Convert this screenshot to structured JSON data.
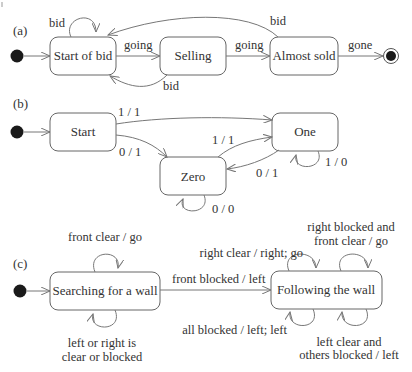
{
  "diagram": {
    "panels": [
      {
        "label": "(a)",
        "states": [
          "Start of bid",
          "Selling",
          "Almost sold"
        ],
        "transitions": [
          {
            "from": "initial",
            "to": "Start of bid",
            "label": ""
          },
          {
            "from": "Start of bid",
            "to": "Start of bid",
            "label": "bid"
          },
          {
            "from": "Start of bid",
            "to": "Selling",
            "label": "going"
          },
          {
            "from": "Selling",
            "to": "Start of bid",
            "label": "bid"
          },
          {
            "from": "Selling",
            "to": "Almost sold",
            "label": "going"
          },
          {
            "from": "Almost sold",
            "to": "Start of bid",
            "label": "bid"
          },
          {
            "from": "Almost sold",
            "to": "final",
            "label": "gone"
          }
        ]
      },
      {
        "label": "(b)",
        "states": [
          "Start",
          "One",
          "Zero"
        ],
        "transitions": [
          {
            "from": "initial",
            "to": "Start",
            "label": ""
          },
          {
            "from": "Start",
            "to": "One",
            "label": "1 / 1"
          },
          {
            "from": "Start",
            "to": "Zero",
            "label": "0 / 1"
          },
          {
            "from": "Zero",
            "to": "One",
            "label": "1 / 1"
          },
          {
            "from": "One",
            "to": "Zero",
            "label": "0 / 1"
          },
          {
            "from": "One",
            "to": "One",
            "label": "1 / 0"
          },
          {
            "from": "Zero",
            "to": "Zero",
            "label": "0 / 0"
          }
        ]
      },
      {
        "label": "(c)",
        "states": [
          "Searching for a wall",
          "Following the wall"
        ],
        "transitions": [
          {
            "from": "initial",
            "to": "Searching for a wall",
            "label": ""
          },
          {
            "from": "Searching for a wall",
            "to": "Searching for a wall",
            "label": "front clear / go"
          },
          {
            "from": "Searching for a wall",
            "to": "Searching for a wall",
            "label_lines": [
              "left or right is",
              "clear or blocked"
            ]
          },
          {
            "from": "Searching for a wall",
            "to": "Following the wall",
            "label": "front blocked / left"
          },
          {
            "from": "Following the wall",
            "to": "Following the wall",
            "label": "right clear / right; go"
          },
          {
            "from": "Following the wall",
            "to": "Following the wall",
            "label_lines": [
              "right blocked and",
              "front clear / go"
            ]
          },
          {
            "from": "Following the wall",
            "to": "Following the wall",
            "label": "all blocked / left; left"
          },
          {
            "from": "Following the wall",
            "to": "Following the wall",
            "label_lines": [
              "left clear and",
              "others blocked / left"
            ]
          }
        ]
      }
    ]
  },
  "a": {
    "label": "(a)",
    "s1": "Start of bid",
    "s2": "Selling",
    "s3": "Almost sold",
    "t_self": "bid",
    "t_going1": "going",
    "t_back": "bid",
    "t_going2": "going",
    "t_top": "bid",
    "t_gone": "gone"
  },
  "b": {
    "label": "(b)",
    "s1": "Start",
    "s2": "One",
    "s3": "Zero",
    "t_start_one": "1 / 1",
    "t_start_zero": "0 / 1",
    "t_zero_one": "1 / 1",
    "t_one_zero": "0 / 1",
    "t_one_self": "1 / 0",
    "t_zero_self": "0 / 0"
  },
  "c": {
    "label": "(c)",
    "s1": "Searching for a wall",
    "s2": "Following the wall",
    "t_s1_top": "front clear / go",
    "t_s1_bottom_1": "left or right is",
    "t_s1_bottom_2": "clear or blocked",
    "t_s1_s2": "front blocked / left",
    "t_s2_topleft": "right clear / right; go",
    "t_s2_topright_1": "right blocked and",
    "t_s2_topright_2": "front clear / go",
    "t_s2_bottomleft": "all blocked / left; left",
    "t_s2_bottomright_1": "left clear and",
    "t_s2_bottomright_2": "others blocked / left"
  },
  "colors": {
    "stroke": "#666666",
    "edge": "#777777",
    "text": "#333333",
    "fill_node": "#1a1a1a"
  }
}
